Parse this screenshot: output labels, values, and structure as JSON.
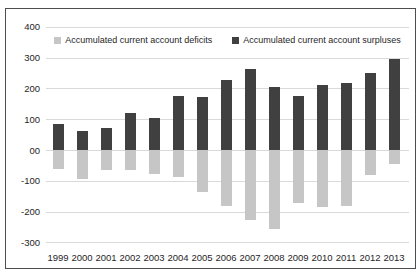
{
  "figure": {
    "background": "#ffffff",
    "border_color": "#4d4d4d"
  },
  "chart_data": {
    "type": "bar",
    "title": "",
    "categories": [
      "1999",
      "2000",
      "2001",
      "2002",
      "2003",
      "2004",
      "2005",
      "2006",
      "2007",
      "2008",
      "2009",
      "2010",
      "2011",
      "2012",
      "2013"
    ],
    "series": [
      {
        "name": "Accumulated current account deficits",
        "color": "#c6c6c6",
        "values": [
          -61,
          -95,
          -65,
          -64,
          -77,
          -88,
          -136,
          -181,
          -226,
          -256,
          -171,
          -186,
          -181,
          -81,
          -45
        ]
      },
      {
        "name": "Accumulated current account surpluses",
        "color": "#404040",
        "values": [
          84,
          63,
          70,
          120,
          104,
          175,
          171,
          226,
          264,
          203,
          176,
          212,
          216,
          250,
          295
        ]
      }
    ],
    "y_axis": {
      "min": -300,
      "max": 400,
      "step": 100,
      "tick_labels": [
        "400",
        "300",
        "200",
        "100",
        "00",
        "-100",
        "-200",
        "-300"
      ]
    },
    "grid": true,
    "gridline_color": "#d9d9d9",
    "text_color": "#262626",
    "legend_position": "top"
  }
}
